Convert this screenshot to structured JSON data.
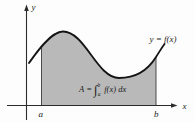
{
  "figure": {
    "colors": {
      "background": "#fdfdfd",
      "area_fill": "#b9b9b9",
      "axis": "#2b2b2b",
      "curve": "#141414",
      "text": "#1a1a1a"
    },
    "labels": {
      "y_axis": "y",
      "x_axis": "x",
      "lower_bound": "a",
      "upper_bound": "b",
      "curve": "y = f(x)"
    },
    "formula": {
      "lhs": "A",
      "equals": " = ",
      "integral": "∫",
      "upper_limit": "b",
      "lower_limit": "a",
      "integrand": " f(x) dx"
    },
    "geometry": {
      "curve_path": "M 29 63 C 36 53 51 31.5 63 31.5 C 85 31.5 97 78 119 78 C 135 78 148 70 156 57 C 159 52.5 161.5 48 164.5 44",
      "area_path": "M 41.5 105.5 L 41.5 47 C 46 38.5 54 31.5 63 31.5 C 85 31.5 97 78 119 78 C 135 78 148 70 156 57 L 156 105.5 Z",
      "x_axis_line": "M 7 105.5 L 171.5 105.5",
      "y_axis_line": "M 26.5 120 L 26.5 10",
      "x_arrowhead": "177.5,105.5 171,103.2 171,107.8",
      "y_arrowhead": "26.5,4.5 24.2,11 28.8,11",
      "a_edge": "M 41.5 105.5 L 41.5 47",
      "b_edge": "M 156 105.5 L 156 57"
    }
  }
}
